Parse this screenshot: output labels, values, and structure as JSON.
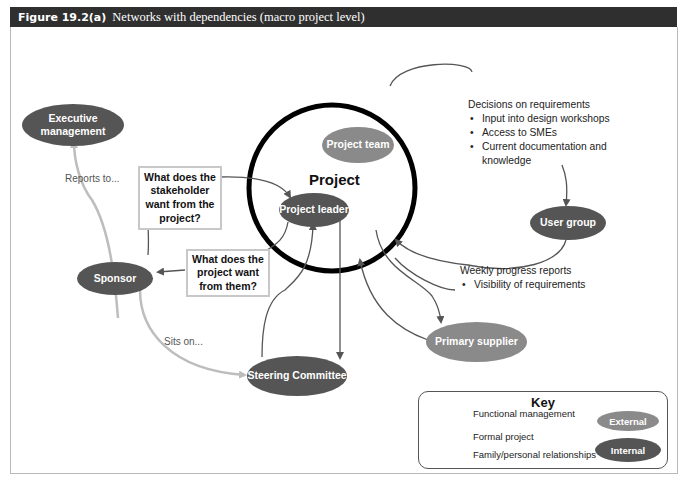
{
  "header": {
    "figure_label": "Figure 19.2(a)",
    "title": "Networks with dependencies (macro project level)"
  },
  "diagram": {
    "center_label": "Project",
    "nodes": {
      "executive_management": "Executive management",
      "project_team": "Project team",
      "project_leader": "Project leader",
      "user_group": "User group",
      "sponsor": "Sponsor",
      "primary_supplier": "Primary supplier",
      "steering_committee": "Steering Committee"
    },
    "questions": {
      "stakeholder_wants": "What does the stakeholder want from the project?",
      "project_wants": "What does the project want from them?"
    },
    "edge_labels": {
      "reports_to": "Reports to...",
      "sits_on": "Sits on..."
    },
    "notes_user_group": {
      "heading": "Decisions on requirements",
      "items": [
        "Input into design workshops",
        "Access to SMEs",
        "Current documentation and knowledge"
      ]
    },
    "notes_supplier": {
      "heading": "Weekly progress reports",
      "items": [
        "Visibility of requirements"
      ]
    }
  },
  "key": {
    "title": "Key",
    "lines": [
      {
        "label": "Functional management",
        "color": "#bdbdbd"
      },
      {
        "label": "Formal project",
        "color": "#444444"
      },
      {
        "label": "Family/personal relationships",
        "color": "#444444"
      }
    ],
    "nodes": [
      {
        "label": "External",
        "color": "#8a8a8a"
      },
      {
        "label": "Internal",
        "color": "#555555"
      }
    ]
  },
  "colors": {
    "internal": "#555555",
    "external": "#8a8a8a",
    "functional_line": "#bdbdbd",
    "formal_line": "#444444",
    "header_bg": "#2f2f2f"
  }
}
